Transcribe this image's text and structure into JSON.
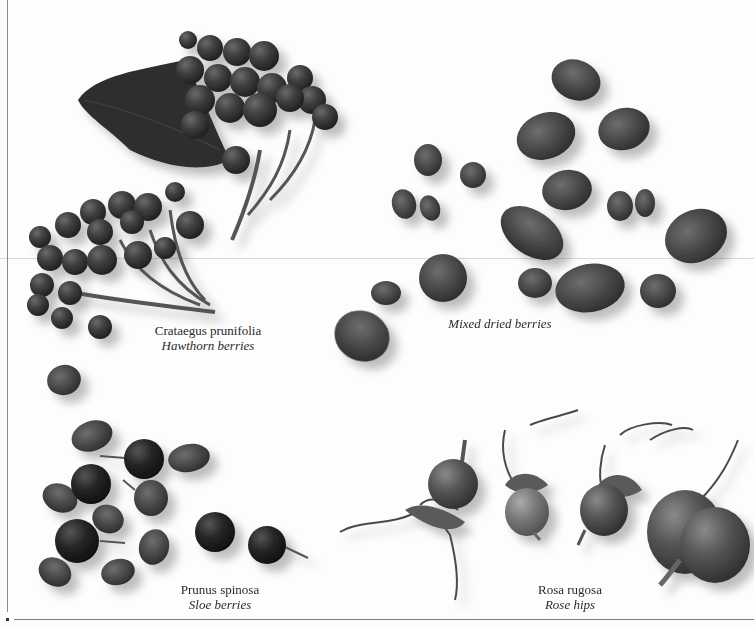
{
  "page": {
    "background": "#fdfdfd",
    "ink_color": "#2a2a2a"
  },
  "specimens": [
    {
      "id": "hawthorn",
      "latin": "Crataegus prunifolia",
      "common": "Hawthorn berries"
    },
    {
      "id": "mixed",
      "latin": "",
      "common": "Mixed dried berries"
    },
    {
      "id": "sloe",
      "latin": "Prunus spinosa",
      "common": "Sloe berries"
    },
    {
      "id": "rosehip",
      "latin": "Rosa rugosa",
      "common": "Rose hips"
    }
  ]
}
